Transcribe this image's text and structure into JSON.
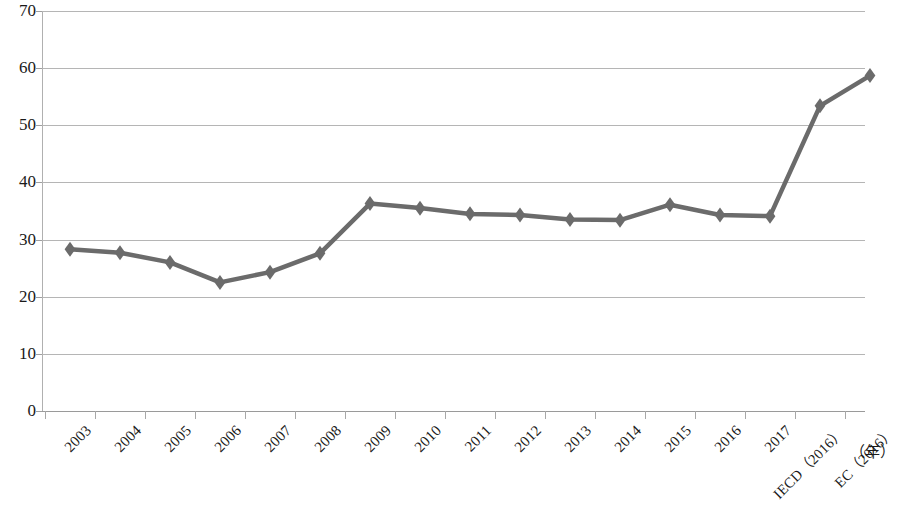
{
  "chart_data": {
    "type": "line",
    "title": "",
    "subtitle": "",
    "xlabel": "（年）",
    "ylabel": "",
    "ylim": [
      0,
      70
    ],
    "ytick_step": 10,
    "yticks": [
      "0",
      "10",
      "20",
      "30",
      "40",
      "50",
      "60",
      "70"
    ],
    "grid": true,
    "legend": "none",
    "series_name": "",
    "line_color": "#6b6b6b",
    "marker": "diamond",
    "marker_color": "#6b6b6b",
    "categories": [
      "2003",
      "2004",
      "2005",
      "2006",
      "2007",
      "2008",
      "2009",
      "2010",
      "2011",
      "2012",
      "2013",
      "2014",
      "2015",
      "2016",
      "2017",
      "IECD（2016）",
      "EC（2016）"
    ],
    "values": [
      28.3,
      27.7,
      26.0,
      22.5,
      24.3,
      27.6,
      36.3,
      35.5,
      34.5,
      34.3,
      33.5,
      33.4,
      36.1,
      34.3,
      34.1,
      53.4,
      58.7
    ]
  },
  "colors": {
    "line": "#6b6b6b",
    "grid": "#b5b5b5",
    "axis": "#9a9a9a",
    "text": "#1a1a1a",
    "background": "#ffffff"
  }
}
